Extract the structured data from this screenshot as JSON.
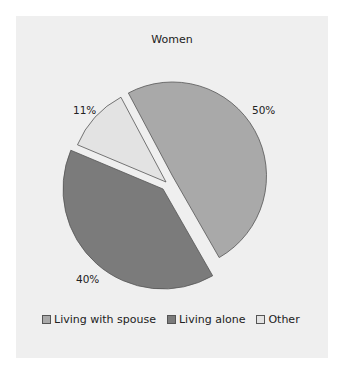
{
  "chart_data": {
    "type": "pie",
    "title": "Women",
    "slices": [
      {
        "label": "Living with spouse",
        "value": 50,
        "display": "50%",
        "color": "#a9a9a9"
      },
      {
        "label": "Living alone",
        "value": 40,
        "display": "40%",
        "color": "#7b7b7b"
      },
      {
        "label": "Other",
        "value": 11,
        "display": "11%",
        "color": "#e3e3e3"
      }
    ],
    "legend_position": "bottom",
    "exploded": true,
    "start_angle_deg": 332
  },
  "colors": {
    "background": "#efefef",
    "outline": "#555555"
  }
}
